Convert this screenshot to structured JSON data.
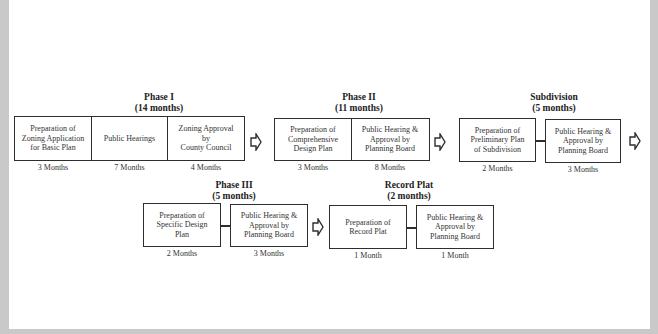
{
  "diagram": {
    "phases": [
      {
        "id": "phase1",
        "title": "Phase I",
        "duration": "(14 months)",
        "steps": [
          {
            "label": "Preparation of\nZoning Application\nfor Basic Plan",
            "months": "3 Months"
          },
          {
            "label": "Public Hearings",
            "months": "7 Months"
          },
          {
            "label": "Zoning Approval\nby\nCounty Council",
            "months": "4 Months"
          }
        ]
      },
      {
        "id": "phase2",
        "title": "Phase II",
        "duration": "(11 months)",
        "steps": [
          {
            "label": "Preparation of\nComprehensive\nDesign Plan",
            "months": "3 Months"
          },
          {
            "label": "Public Hearing &\nApproval by\nPlanning Board",
            "months": "8 Months"
          }
        ]
      },
      {
        "id": "subdivision",
        "title": "Subdivision",
        "duration": "(5 months)",
        "steps": [
          {
            "label": "Preparation of\nPreliminary Plan\nof Subdivision",
            "months": "2 Months"
          },
          {
            "label": "Public Hearing &\nApproval by\nPlanning Board",
            "months": "3 Months"
          }
        ]
      },
      {
        "id": "phase3",
        "title": "Phase III",
        "duration": "(5 months)",
        "steps": [
          {
            "label": "Preparation of\nSpecific Design\nPlan",
            "months": "2 Months"
          },
          {
            "label": "Public Hearing &\nApproval by\nPlanning Board",
            "months": "3 Months"
          }
        ]
      },
      {
        "id": "record_plat",
        "title": "Record Plat",
        "duration": "(2 months)",
        "steps": [
          {
            "label": "Preparation of\nRecord Plat",
            "months": "1 Month"
          },
          {
            "label": "Public Hearing &\nApproval by\nPlanning Board",
            "months": "1 Month"
          }
        ]
      }
    ],
    "arrow_icon": "hollow-right-arrow",
    "colors": {
      "line": "#2e2e2e",
      "background": "#ffffff",
      "frame": "#c9c9c9"
    }
  }
}
